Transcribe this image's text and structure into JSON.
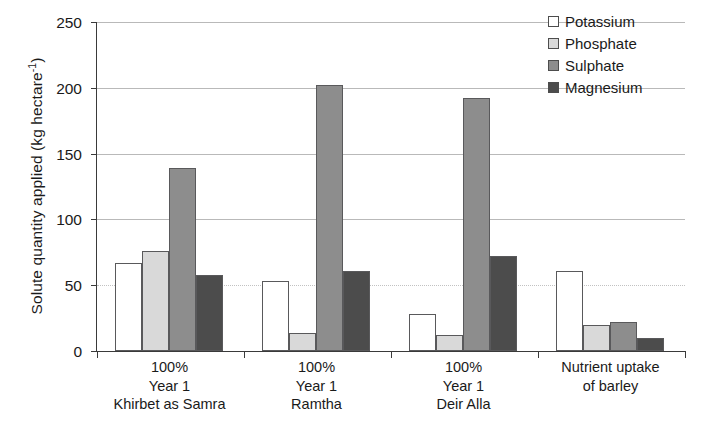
{
  "chart_data": {
    "type": "bar",
    "title": "",
    "xlabel": "",
    "ylabel": "Solute quantity applied (kg hectare",
    "ylabel_exponent": "-1",
    "ylabel_close": ")",
    "ylim": [
      0,
      250
    ],
    "yticks": [
      0,
      50,
      100,
      150,
      200,
      250
    ],
    "grid": true,
    "legend_position": "top-right",
    "categories": [
      "100%\nYear 1\nKhirbet as Samra",
      "100%\nYear 1\nRamtha",
      "100%\nYear 1\nDeir Alla",
      "Nutrient uptake\nof barley"
    ],
    "category_lines": [
      [
        "100%",
        "Year 1",
        "Khirbet as Samra"
      ],
      [
        "100%",
        "Year 1",
        "Ramtha"
      ],
      [
        "100%",
        "Year 1",
        "Deir Alla"
      ],
      [
        "Nutrient uptake",
        "of barley"
      ]
    ],
    "series": [
      {
        "name": "Potassium",
        "color": "#ffffff",
        "values": [
          67,
          53,
          28,
          61
        ]
      },
      {
        "name": "Phosphate",
        "color": "#d9d9d9",
        "values": [
          76,
          14,
          12,
          20
        ]
      },
      {
        "name": "Sulphate",
        "color": "#8d8d8d",
        "values": [
          139,
          202,
          192,
          22
        ]
      },
      {
        "name": "Magnesium",
        "color": "#4c4c4c",
        "values": [
          58,
          61,
          72,
          10
        ]
      }
    ]
  },
  "legend": {
    "items": [
      {
        "label": "Potassium"
      },
      {
        "label": "Phosphate"
      },
      {
        "label": "Sulphate"
      },
      {
        "label": "Magnesium"
      }
    ]
  },
  "axis": {
    "ytick_labels": [
      "250",
      "200",
      "150",
      "100",
      "50",
      "0"
    ]
  }
}
